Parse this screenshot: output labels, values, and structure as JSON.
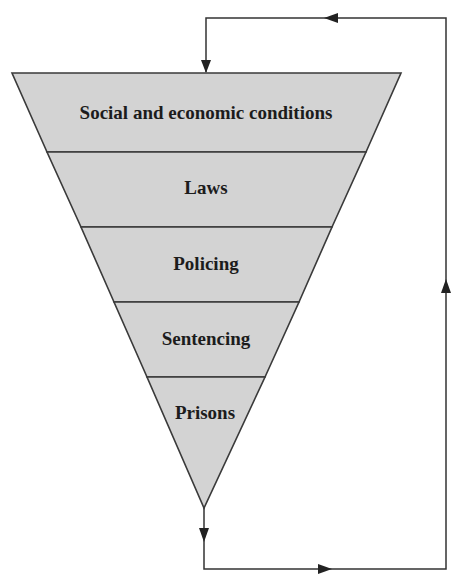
{
  "diagram": {
    "type": "inverted-funnel-with-feedback-loop",
    "colors": {
      "fill": "#d3d3d3",
      "stroke": "#3a3a3a",
      "text": "#1c1c1c",
      "background": "#ffffff"
    },
    "layers": [
      {
        "label": "Social and economic conditions"
      },
      {
        "label": "Laws"
      },
      {
        "label": "Policing"
      },
      {
        "label": "Sentencing"
      },
      {
        "label": "Prisons"
      }
    ],
    "feedback_loop": {
      "direction": "from bottom of funnel (Prisons) back to top (Social and economic conditions)",
      "arrows": [
        {
          "segment": "down-from-funnel-tip",
          "icon": "arrow-down-icon"
        },
        {
          "segment": "bottom-rightward",
          "icon": "arrow-right-icon"
        },
        {
          "segment": "right-upward",
          "icon": "arrow-up-icon"
        },
        {
          "segment": "top-leftward",
          "icon": "arrow-left-icon"
        },
        {
          "segment": "down-into-funnel-top",
          "icon": "arrow-down-icon"
        }
      ]
    }
  }
}
